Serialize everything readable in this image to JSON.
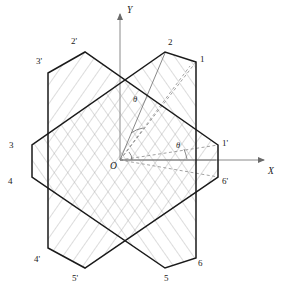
{
  "figure": {
    "background": "#ffffff",
    "stroke_dark": "#1a1a1a",
    "stroke_hatch": "#9a9a9a",
    "stroke_axis": "#8a8a8a",
    "stroke_dash": "#8a8a8a"
  },
  "axes": {
    "x_label": "X",
    "y_label": "Y",
    "origin_label": "O",
    "x_axis_from": [
      120,
      160
    ],
    "x_axis_to": [
      268,
      160
    ],
    "y_axis_from": [
      120,
      160
    ],
    "y_axis_to": [
      120,
      10
    ]
  },
  "angles": {
    "theta_upper_label": "θ",
    "theta_upper_pos": [
      135,
      100
    ],
    "theta_lower_label": "θ",
    "theta_lower_pos": [
      178,
      146
    ]
  },
  "hexagon_primed": {
    "name": "hexagon-primed",
    "labels": [
      "1'",
      "2'",
      "3'",
      "4'",
      "5'",
      "6'"
    ],
    "vertices": [
      [
        218,
        145
      ],
      [
        85,
        52
      ],
      [
        48,
        73
      ],
      [
        48,
        248
      ],
      [
        85,
        268
      ],
      [
        218,
        177
      ]
    ],
    "label_positions": [
      [
        222,
        143
      ],
      [
        74,
        41
      ],
      [
        38,
        63
      ],
      [
        36,
        258
      ],
      [
        76,
        278
      ],
      [
        224,
        180
      ]
    ]
  },
  "hexagon_unprimed": {
    "name": "hexagon-unprimed",
    "labels": [
      "1",
      "2",
      "3",
      "4",
      "5",
      "6"
    ],
    "vertices": [
      [
        196,
        62
      ],
      [
        165,
        52
      ],
      [
        32,
        145
      ],
      [
        32,
        177
      ],
      [
        165,
        268
      ],
      [
        196,
        258
      ]
    ],
    "label_positions": [
      [
        200,
        58
      ],
      [
        170,
        42
      ],
      [
        12,
        143
      ],
      [
        10,
        180
      ],
      [
        168,
        280
      ],
      [
        200,
        264
      ]
    ]
  },
  "hatching": {
    "primed_angle_deg": 35,
    "unprimed_angle_deg": -35,
    "spacing_px": 11,
    "color": "#9a9a9a"
  },
  "construction_lines": {
    "dashed": [
      {
        "from": [
          120,
          160
        ],
        "to": [
          196,
          62
        ]
      },
      {
        "from": [
          120,
          160
        ],
        "to": [
          218,
          145
        ]
      },
      {
        "from": [
          120,
          160
        ],
        "to": [
          218,
          177
        ]
      },
      {
        "from": [
          120,
          160
        ],
        "to": [
          190,
          66
        ]
      }
    ],
    "solid_radius": [
      {
        "from": [
          120,
          160
        ],
        "to": [
          218,
          160
        ]
      },
      {
        "from": [
          120,
          160
        ],
        "to": [
          165,
          52
        ]
      }
    ]
  }
}
